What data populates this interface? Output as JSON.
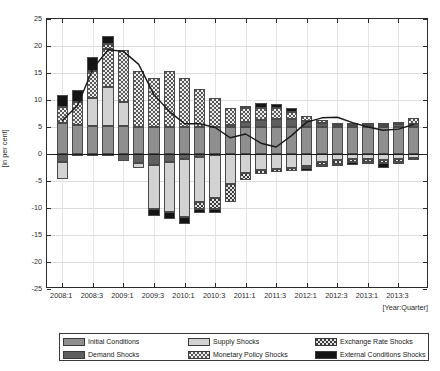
{
  "chart_data": {
    "type": "bar",
    "title": "",
    "xlabel": "[Year:Quarter]",
    "ylabel": "[in per cent]",
    "ylim": [
      -25,
      25
    ],
    "ytick_values": [
      -25,
      -20,
      -15,
      -10,
      -5,
      0,
      5,
      10,
      15,
      20,
      25
    ],
    "ytick_labels": [
      "-25",
      "-20",
      "-15",
      "-10",
      "-5",
      "0",
      "5",
      "10",
      "15",
      "20",
      "25"
    ],
    "grid": true,
    "legend_position": "below-axes",
    "stacked": true,
    "categories": [
      "2008:1",
      "2008:2",
      "2008:3",
      "2008:4",
      "2009:1",
      "2009:2",
      "2009:3",
      "2009:4",
      "2010:1",
      "2010:2",
      "2010:3",
      "2010:4",
      "2011:1",
      "2011:2",
      "2011:3",
      "2011:4",
      "2012:1",
      "2012:2",
      "2012:3",
      "2012:4",
      "2013:1",
      "2013:2",
      "2013:3",
      "2013:4"
    ],
    "xtick_labels": [
      "2008:1",
      "2008:3",
      "2009:1",
      "2009:3",
      "2010:1",
      "2010:3",
      "2011:1",
      "2011:3",
      "2012:1",
      "2012:3",
      "2013:1",
      "2013:3"
    ],
    "xtick_indices": [
      0,
      2,
      4,
      6,
      8,
      10,
      12,
      14,
      16,
      18,
      20,
      22
    ],
    "series": [
      {
        "name": "Initial Conditions",
        "key": "initial",
        "fill": "p-initial",
        "color": "#8f8f8f",
        "values": [
          5.8,
          5.4,
          5.2,
          5.2,
          5.1,
          5.0,
          5.0,
          5.0,
          5.0,
          5.0,
          5.0,
          5.0,
          5.0,
          5.0,
          5.0,
          5.0,
          5.0,
          5.0,
          5.0,
          5.0,
          5.0,
          5.0,
          5.0,
          5.0
        ]
      },
      {
        "name": "Demand Shocks",
        "key": "demand",
        "fill": "p-demand",
        "color": "#5f5f5f",
        "values": [
          -1.4,
          -0.4,
          -0.3,
          -0.3,
          -1.3,
          -1.6,
          -2.0,
          -1.4,
          -1.0,
          -0.6,
          -0.2,
          0.3,
          0.9,
          1.3,
          1.5,
          1.4,
          1.1,
          0.7,
          0.4,
          0.3,
          0.3,
          0.4,
          0.5,
          0.6
        ]
      },
      {
        "name": "Supply Shocks",
        "key": "supply",
        "fill": "p-supply",
        "color": "#d2d2d2",
        "values": [
          -3.3,
          0.0,
          5.1,
          7.2,
          4.5,
          -1.0,
          -8.2,
          -9.4,
          -10.6,
          -8.2,
          -8.0,
          -5.5,
          -3.5,
          -3.0,
          -2.8,
          -2.6,
          -2.2,
          -1.5,
          -1.2,
          -1.0,
          -1.0,
          -1.1,
          -0.9,
          -0.8
        ]
      },
      {
        "name": "Monetary Policy Shocks",
        "key": "monetary",
        "fill": "p-monetary",
        "color": "#ededed",
        "values": [
          2.9,
          4.3,
          5.1,
          7.1,
          9.7,
          10.3,
          9.1,
          10.4,
          9.0,
          7.1,
          5.3,
          3.3,
          2.6,
          2.3,
          2.0,
          1.4,
          1.0,
          0.6,
          0.4,
          0.4,
          0.4,
          0.4,
          0.5,
          1.1
        ]
      },
      {
        "name": "Exchange Rate Shocks",
        "key": "exchange",
        "fill": "p-exchange",
        "color": "#e3e3e3",
        "values": [
          0.0,
          0.0,
          0.0,
          0.9,
          0.0,
          0.0,
          0.0,
          0.0,
          0.0,
          -1.4,
          -2.0,
          -3.3,
          -1.4,
          -0.7,
          -0.6,
          -0.5,
          -0.4,
          -0.5,
          -0.6,
          -0.5,
          -0.4,
          -0.6,
          -0.5,
          -0.4
        ]
      },
      {
        "name": "External Conditions Shocks",
        "key": "external",
        "fill": "p-external",
        "color": "#141414",
        "values": [
          2.2,
          2.2,
          2.6,
          1.5,
          0.0,
          0.0,
          -1.2,
          -1.2,
          -1.4,
          -0.7,
          -0.8,
          0.0,
          0.4,
          0.9,
          0.8,
          0.7,
          -0.5,
          -0.5,
          -0.5,
          -0.6,
          -0.5,
          -0.9,
          -0.4,
          0.0
        ]
      }
    ],
    "line_series": {
      "name": "Actual",
      "color": "#1a1a1a",
      "values": [
        6.2,
        9.0,
        15.8,
        19.3,
        19.0,
        16.6,
        11.0,
        7.9,
        5.6,
        5.6,
        4.9,
        3.0,
        3.7,
        2.0,
        1.3,
        3.4,
        5.9,
        6.7,
        6.8,
        5.8,
        5.0,
        4.4,
        4.6,
        5.5
      ]
    }
  },
  "legend": {
    "entries": [
      {
        "label": "Initial Conditions",
        "fill": "p-initial"
      },
      {
        "label": "Demand Shocks",
        "fill": "p-demand"
      },
      {
        "label": "Supply Shocks",
        "fill": "p-supply"
      },
      {
        "label": "Monetary Policy Shocks",
        "fill": "p-monetary"
      },
      {
        "label": "Exchange Rate Shocks",
        "fill": "p-exchange"
      },
      {
        "label": "External Conditions Shocks",
        "fill": "p-external"
      }
    ]
  }
}
